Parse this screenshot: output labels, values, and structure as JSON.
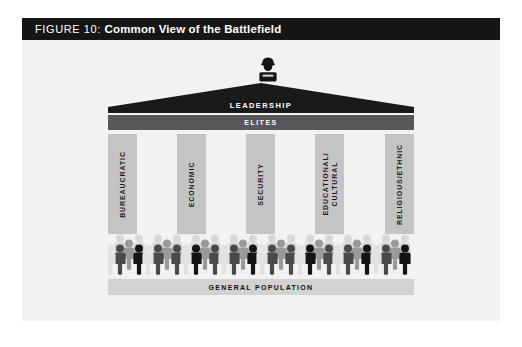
{
  "figure": {
    "title_prefix": "FIGURE 10: ",
    "title_main": "Common View of the Battlefield",
    "roof_label": "LEADERSHIP",
    "elites_label": "ELITES",
    "base_label": "GENERAL POPULATION",
    "leader_icon": "officer-figure-icon",
    "columns": [
      {
        "label": "BUREAUCRATIC"
      },
      {
        "label": "ECONOMIC"
      },
      {
        "label": "SECURITY"
      },
      {
        "label": "EDUCATIONAL/\nCULTURAL"
      },
      {
        "label": "RELIGIOUS/ETHNIC"
      }
    ],
    "colors": {
      "title_bar": "#161616",
      "title_text": "#ffffff",
      "panel_background": "#f2f2f1",
      "roof": "#1a1a1a",
      "elites_band": "#58585a",
      "column": "#c4c4c4",
      "base_band": "#d2d2d2",
      "crowd_back_row": "#d8d8d8",
      "crowd_mid": "#8d8d8d",
      "crowd_dark": "#4a4a4a",
      "crowd_black": "#141414"
    }
  }
}
